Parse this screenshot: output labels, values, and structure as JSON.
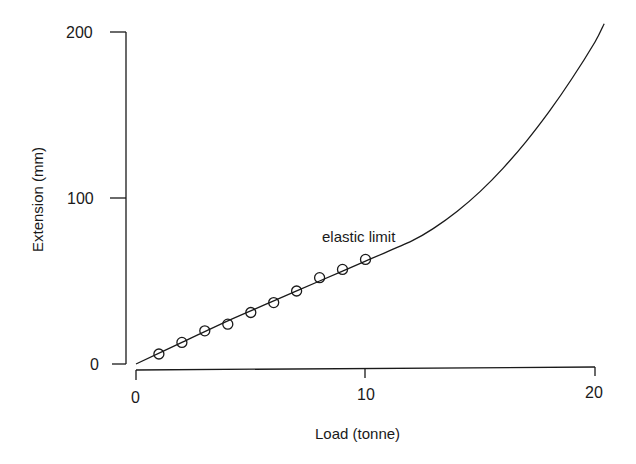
{
  "chart_data": {
    "type": "scatter",
    "title": "",
    "xlabel": "Load (tonne)",
    "ylabel": "Extension (mm)",
    "xlim": [
      0,
      20
    ],
    "ylim": [
      0,
      200
    ],
    "xticks": [
      "0",
      "10",
      "20"
    ],
    "yticks": [
      "0",
      "100",
      "200"
    ],
    "grid": false,
    "legend": null,
    "series": [
      {
        "name": "measured",
        "type": "scatter",
        "marker": "open-circle",
        "x": [
          1,
          2,
          3,
          4,
          5,
          6,
          7,
          8,
          9,
          10
        ],
        "y": [
          6,
          13,
          20,
          24,
          31,
          37,
          44,
          52,
          57,
          63
        ]
      },
      {
        "name": "fitted curve",
        "type": "line",
        "x": [
          0,
          2,
          4,
          6,
          8,
          10,
          12,
          13,
          14,
          15,
          16,
          17,
          18,
          19,
          20,
          20.4
        ],
        "y": [
          0,
          13,
          26,
          38,
          50,
          62,
          74,
          82,
          92,
          104,
          118,
          134,
          152,
          172,
          194,
          205
        ]
      }
    ],
    "annotations": [
      {
        "text": "elastic limit",
        "x": 10.8,
        "y": 75
      }
    ]
  },
  "axes": {
    "x": {
      "title": "Load (tonne)",
      "ticks": [
        "0",
        "10",
        "20"
      ]
    },
    "y": {
      "title": "Extension (mm)",
      "ticks": [
        "0",
        "100",
        "200"
      ]
    }
  },
  "annotation": {
    "label": "elastic limit"
  },
  "colors": {
    "ink": "#1a1a1a",
    "background": "#ffffff"
  }
}
